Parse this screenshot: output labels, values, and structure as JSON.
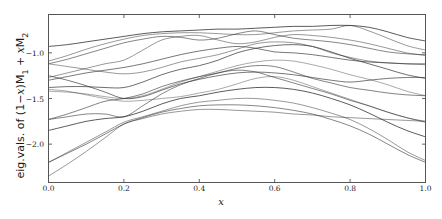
{
  "figure": {
    "width": 442,
    "height": 219,
    "background": "#ffffff",
    "line_color": "#333333",
    "frame_color": "#555555"
  },
  "chart_data": {
    "type": "line",
    "title": "",
    "xlabel": "x",
    "ylabel_plain": "eig.vals. of (1 - x)M_1 + x M_2",
    "ylabel_parts": {
      "prefix": "eig.vals. of (1−",
      "var1": "x",
      "mid": ")M",
      "sub1": "1",
      "plus": " + ",
      "var2": "x",
      "m2": "M",
      "sub2": "2"
    },
    "xlim": [
      0.0,
      1.0
    ],
    "ylim": [
      -2.42,
      -0.58
    ],
    "xticks": [
      0.0,
      0.2,
      0.4,
      0.6,
      0.8,
      1.0
    ],
    "xticklabels": [
      "0.0",
      "0.2",
      "0.4",
      "0.6",
      "0.8",
      "1.0"
    ],
    "yticks": [
      -1.0,
      -1.5,
      -2.0
    ],
    "yticklabels": [
      "−1.0",
      "−1.5",
      "−2.0"
    ],
    "grid": false,
    "legend": false,
    "legend_position": "none",
    "x": [
      0.0,
      0.05,
      0.1,
      0.15,
      0.2,
      0.25,
      0.3,
      0.35,
      0.4,
      0.45,
      0.5,
      0.55,
      0.6,
      0.65,
      0.7,
      0.75,
      0.8,
      0.85,
      0.9,
      0.95,
      1.0
    ],
    "series": [
      {
        "name": "eig-1",
        "values": [
          -0.93,
          -0.91,
          -0.88,
          -0.85,
          -0.82,
          -0.79,
          -0.77,
          -0.76,
          -0.75,
          -0.74,
          -0.74,
          -0.73,
          -0.72,
          -0.71,
          -0.71,
          -0.7,
          -0.7,
          -0.72,
          -0.77,
          -0.83,
          -0.87
        ]
      },
      {
        "name": "eig-2",
        "values": [
          -1.09,
          -1.03,
          -0.96,
          -0.9,
          -0.85,
          -0.81,
          -0.79,
          -0.78,
          -0.78,
          -0.79,
          -0.8,
          -0.8,
          -0.78,
          -0.76,
          -0.75,
          -0.74,
          -0.7,
          -0.76,
          -0.84,
          -0.92,
          -0.97
        ]
      },
      {
        "name": "eig-3",
        "values": [
          -1.12,
          -1.07,
          -1.01,
          -0.95,
          -0.89,
          -0.85,
          -0.82,
          -0.83,
          -0.86,
          -0.84,
          -0.79,
          -0.76,
          -0.8,
          -0.84,
          -0.86,
          -0.88,
          -0.91,
          -0.95,
          -0.99,
          -1.01,
          -1.02
        ]
      },
      {
        "name": "eig-4",
        "values": [
          -1.27,
          -1.22,
          -1.17,
          -1.12,
          -1.08,
          -0.97,
          -0.86,
          -0.82,
          -0.81,
          -0.86,
          -0.9,
          -0.88,
          -0.83,
          -0.8,
          -0.81,
          -0.83,
          -0.86,
          -0.9,
          -0.95,
          -1.0,
          -1.03
        ]
      },
      {
        "name": "eig-5",
        "values": [
          -1.3,
          -1.26,
          -1.22,
          -1.19,
          -1.16,
          -1.12,
          -1.07,
          -1.02,
          -0.98,
          -0.95,
          -0.93,
          -0.95,
          -0.99,
          -1.0,
          -1.02,
          -1.05,
          -1.08,
          -1.1,
          -1.11,
          -1.12,
          -1.12
        ]
      },
      {
        "name": "eig-6",
        "values": [
          -1.12,
          -1.15,
          -1.18,
          -1.21,
          -1.23,
          -1.21,
          -1.16,
          -1.1,
          -1.06,
          -1.02,
          -0.96,
          -0.9,
          -0.88,
          -0.89,
          -0.93,
          -1.0,
          -1.05,
          -1.09,
          -1.11,
          -1.12,
          -1.13
        ]
      },
      {
        "name": "eig-7",
        "values": [
          -1.38,
          -1.37,
          -1.37,
          -1.38,
          -1.38,
          -1.32,
          -1.24,
          -1.18,
          -1.14,
          -1.08,
          -1.0,
          -0.95,
          -0.92,
          -0.91,
          -0.93,
          -0.99,
          -1.06,
          -1.12,
          -1.18,
          -1.24,
          -1.28
        ]
      },
      {
        "name": "eig-8",
        "values": [
          -1.42,
          -1.43,
          -1.45,
          -1.48,
          -1.5,
          -1.47,
          -1.4,
          -1.32,
          -1.26,
          -1.2,
          -1.14,
          -1.1,
          -1.08,
          -1.09,
          -1.13,
          -1.18,
          -1.24,
          -1.29,
          -1.35,
          -1.42,
          -1.47
        ]
      },
      {
        "name": "eig-9",
        "values": [
          -1.25,
          -1.3,
          -1.36,
          -1.43,
          -1.5,
          -1.48,
          -1.41,
          -1.34,
          -1.29,
          -1.25,
          -1.22,
          -1.21,
          -1.22,
          -1.24,
          -1.27,
          -1.3,
          -1.32,
          -1.3,
          -1.28,
          -1.27,
          -1.27
        ]
      },
      {
        "name": "eig-10",
        "values": [
          -1.73,
          -1.67,
          -1.6,
          -1.53,
          -1.5,
          -1.45,
          -1.37,
          -1.31,
          -1.26,
          -1.22,
          -1.17,
          -1.14,
          -1.15,
          -1.21,
          -1.28,
          -1.33,
          -1.38,
          -1.41,
          -1.44,
          -1.46,
          -1.47
        ]
      },
      {
        "name": "eig-11",
        "values": [
          -1.73,
          -1.7,
          -1.67,
          -1.67,
          -1.7,
          -1.58,
          -1.45,
          -1.35,
          -1.28,
          -1.22,
          -1.19,
          -1.21,
          -1.27,
          -1.33,
          -1.39,
          -1.45,
          -1.52,
          -1.58,
          -1.65,
          -1.71,
          -1.76
        ]
      },
      {
        "name": "eig-12",
        "values": [
          -1.4,
          -1.42,
          -1.46,
          -1.5,
          -1.53,
          -1.52,
          -1.5,
          -1.48,
          -1.44,
          -1.4,
          -1.34,
          -1.28,
          -1.26,
          -1.3,
          -1.37,
          -1.44,
          -1.51,
          -1.58,
          -1.65,
          -1.71,
          -1.75
        ]
      },
      {
        "name": "eig-13",
        "values": [
          -1.85,
          -1.8,
          -1.75,
          -1.72,
          -1.7,
          -1.64,
          -1.56,
          -1.5,
          -1.47,
          -1.43,
          -1.4,
          -1.38,
          -1.38,
          -1.4,
          -1.44,
          -1.5,
          -1.57,
          -1.66,
          -1.76,
          -1.85,
          -1.92
        ]
      },
      {
        "name": "eig-14",
        "values": [
          -2.2,
          -2.09,
          -1.98,
          -1.87,
          -1.76,
          -1.7,
          -1.64,
          -1.58,
          -1.54,
          -1.52,
          -1.5,
          -1.5,
          -1.52,
          -1.55,
          -1.6,
          -1.66,
          -1.73,
          -1.83,
          -1.95,
          -2.08,
          -2.18
        ]
      },
      {
        "name": "eig-15",
        "values": [
          -2.2,
          -2.1,
          -2.0,
          -1.89,
          -1.78,
          -1.71,
          -1.65,
          -1.61,
          -1.58,
          -1.57,
          -1.57,
          -1.58,
          -1.6,
          -1.63,
          -1.67,
          -1.73,
          -1.8,
          -1.89,
          -2.0,
          -2.11,
          -2.2
        ]
      },
      {
        "name": "eig-16",
        "values": [
          -2.35,
          -2.22,
          -2.08,
          -1.93,
          -1.78,
          -1.72,
          -1.67,
          -1.64,
          -1.62,
          -1.62,
          -1.63,
          -1.64,
          -1.65,
          -1.67,
          -1.68,
          -1.7,
          -1.71,
          -1.72,
          -1.73,
          -1.74,
          -1.75
        ]
      }
    ]
  }
}
